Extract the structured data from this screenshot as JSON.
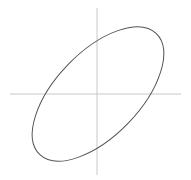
{
  "diagram": {
    "type": "tilted-ellipse-on-axes",
    "axes": {
      "color": "#c8c8c8",
      "center": [
        97,
        94
      ]
    },
    "ellipse": {
      "stroke": "#555555",
      "cx": 98,
      "cy": 94,
      "rx": 84,
      "ry": 42,
      "rotation_deg": -46
    }
  }
}
